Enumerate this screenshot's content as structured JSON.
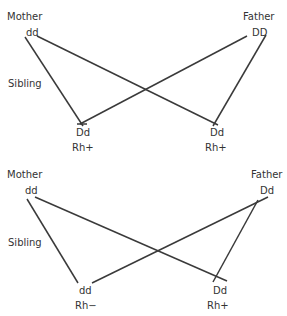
{
  "diagrams": [
    {
      "mother": {
        "label": "Mother",
        "genotype": "dd"
      },
      "father": {
        "label": "Father",
        "genotype": "DD"
      },
      "sibling_label": "Sibling",
      "children": [
        {
          "genotype": "Dd",
          "phenotype": "Rh+"
        },
        {
          "genotype": "Dd",
          "phenotype": "Rh+"
        }
      ]
    },
    {
      "mother": {
        "label": "Mother",
        "genotype": "dd"
      },
      "father": {
        "label": "Father",
        "genotype": "Dd"
      },
      "sibling_label": "Sibling",
      "children": [
        {
          "genotype": "dd",
          "phenotype": "Rh−"
        },
        {
          "genotype": "Dd",
          "phenotype": "Rh+"
        }
      ]
    }
  ],
  "colors": {
    "line": "#3a3a3a",
    "text": "#333333",
    "background": "#ffffff"
  }
}
